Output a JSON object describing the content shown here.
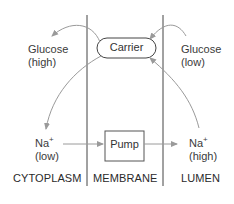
{
  "diagram": {
    "carrier": {
      "label": "Carrier"
    },
    "pump": {
      "label": "Pump"
    },
    "cytoplasm_glucose": {
      "name": "Glucose",
      "level": "(high)"
    },
    "lumen_glucose": {
      "name": "Glucose",
      "level": "(low)"
    },
    "cytoplasm_na": {
      "name": "Na",
      "charge": "+",
      "level": "(low)"
    },
    "lumen_na": {
      "name": "Na",
      "charge": "+",
      "level": "(high)"
    },
    "regions": [
      "CYTOPLASM",
      "MEMBRANE",
      "LUMEN"
    ],
    "colors": {
      "line": "#444444",
      "arrow": "#999999",
      "text": "#333333"
    }
  }
}
